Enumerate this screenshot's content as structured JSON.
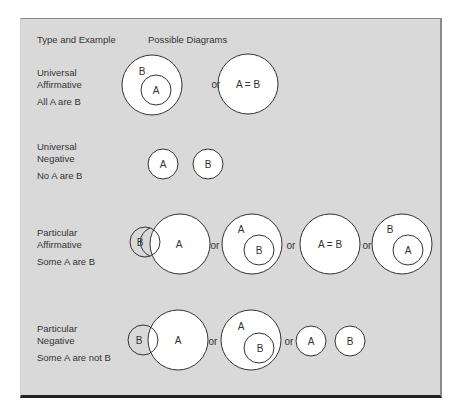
{
  "headers": {
    "type_and_example": "Type and Example",
    "possible_diagrams": "Possible Diagrams"
  },
  "rows": [
    {
      "type_line1": "Universal",
      "type_line2": "Affirmative",
      "example": "All A are B"
    },
    {
      "type_line1": "Universal",
      "type_line2": "Negative",
      "example": "No A are B"
    },
    {
      "type_line1": "Particular",
      "type_line2": "Affirmative",
      "example": "Some A are B"
    },
    {
      "type_line1": "Particular",
      "type_line2": "Negative",
      "example": "Some A are not B"
    }
  ],
  "labels": {
    "A": "A",
    "B": "B",
    "AeqB": "A = B",
    "or": "or"
  },
  "colors": {
    "panel_bg": "#d9d9d9",
    "circle_fill": "#ffffff",
    "circle_stroke": "#333333",
    "text": "#333333"
  }
}
